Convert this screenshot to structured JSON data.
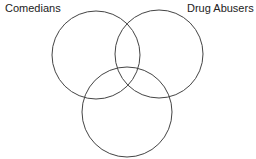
{
  "diagram": {
    "type": "venn",
    "sets": [
      {
        "label": "Comedians",
        "cx": 96,
        "cy": 55,
        "r": 44
      },
      {
        "label": "Drug Abusers",
        "cx": 159,
        "cy": 54,
        "r": 44
      },
      {
        "label": "",
        "cx": 127,
        "cy": 112,
        "r": 45
      }
    ],
    "stroke_color": "#444444"
  }
}
